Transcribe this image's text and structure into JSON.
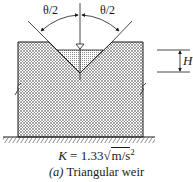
{
  "diagram": {
    "type": "triangular-weir-cross-section",
    "labels": {
      "left_angle": "θ/2",
      "right_angle": "θ/2",
      "head": "H"
    },
    "formula": {
      "symbol": "K",
      "equals": " = 1.33",
      "radical": "m/s",
      "exponent": "2"
    },
    "caption": {
      "prefix": "(a)",
      "text": " Triangular weir"
    },
    "colors": {
      "line": "#1a1a1a",
      "hatch": "#555555",
      "water": "#8a8a8a",
      "background": "#ffffff"
    }
  }
}
